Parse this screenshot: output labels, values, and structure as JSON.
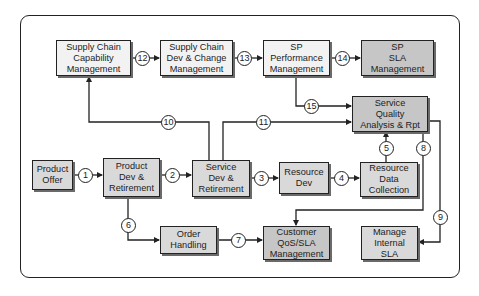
{
  "diagram": {
    "boxes": {
      "sc_capability": "Supply Chain\nCapability\nManagement",
      "sc_dev_change": "Supply Chain\nDev & Change\nManagement",
      "sp_performance": "SP\nPerformance\nManagement",
      "sp_sla": "SP\nSLA\nManagement",
      "service_quality": "Service\nQuality\nAnalysis & Rpt",
      "product_offer": "Product\nOffer",
      "product_dev": "Product\nDev &\nRetirement",
      "service_dev": "Service\nDev &\nRetirement",
      "resource_dev": "Resource\nDev",
      "resource_data": "Resource\nData\nCollection",
      "order_handling": "Order\nHandling",
      "customer_qos": "Customer\nQoS/SLA\nManagement",
      "manage_internal_sla": "Manage\nInternal\nSLA"
    },
    "flows": {
      "f1": "1",
      "f2": "2",
      "f3": "3",
      "f4": "4",
      "f5": "5",
      "f6": "6",
      "f7": "7",
      "f8": "8",
      "f9": "9",
      "f10": "10",
      "f11": "11",
      "f12": "12",
      "f13": "13",
      "f14": "14",
      "f15": "15"
    },
    "colors": {
      "light_box": "#f2f2f2",
      "mid_box": "#d9d9d9",
      "dark_box": "#c6c6c6",
      "line": "#222222"
    }
  }
}
